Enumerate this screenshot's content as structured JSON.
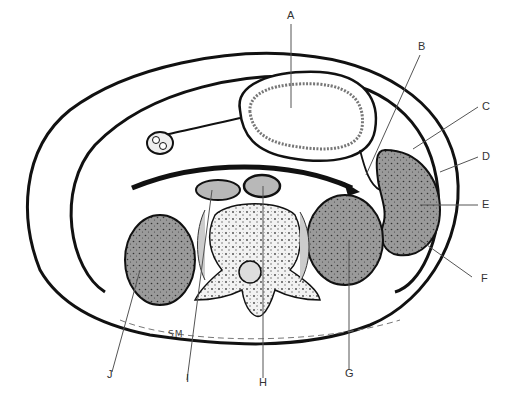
{
  "figure": {
    "signature": "SM",
    "colors": {
      "outline": "#111111",
      "organ_fill": "#9a9a9a",
      "vessel_fill": "#b8b8b8",
      "background": "#ffffff",
      "leader_line": "#555555"
    }
  },
  "labels": [
    {
      "id": "A",
      "text": "A"
    },
    {
      "id": "B",
      "text": "B"
    },
    {
      "id": "C",
      "text": "C"
    },
    {
      "id": "D",
      "text": "D"
    },
    {
      "id": "E",
      "text": "E"
    },
    {
      "id": "F",
      "text": "F"
    },
    {
      "id": "G",
      "text": "G"
    },
    {
      "id": "H",
      "text": "H"
    },
    {
      "id": "I",
      "text": "I"
    },
    {
      "id": "J",
      "text": "J"
    }
  ]
}
